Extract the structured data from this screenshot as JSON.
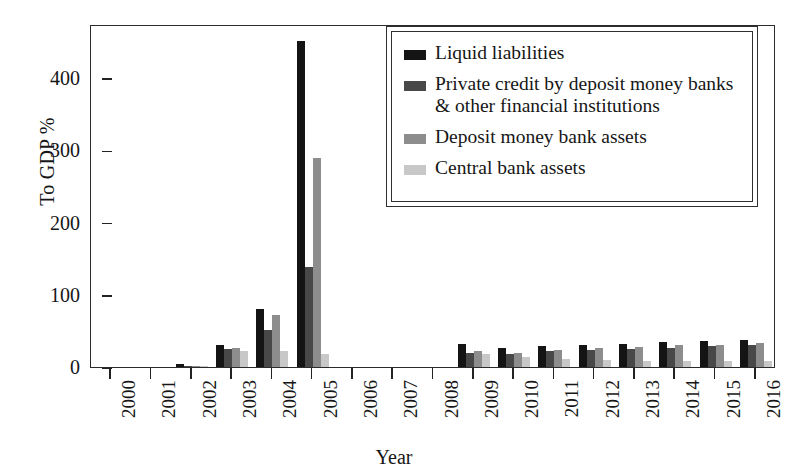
{
  "chart_data": {
    "type": "bar",
    "title": "",
    "xlabel": "Year",
    "ylabel": "To GDP %",
    "ylim": [
      0,
      475
    ],
    "yticks": [
      0,
      100,
      200,
      300,
      400
    ],
    "grid": false,
    "legend_position": "top-right",
    "categories": [
      "2000",
      "2001",
      "2002",
      "2003",
      "2004",
      "2005",
      "2006",
      "2007",
      "2008",
      "2009",
      "2010",
      "2011",
      "2012",
      "2013",
      "2014",
      "2015",
      "2016"
    ],
    "series": [
      {
        "name": "Liquid liabilities",
        "color": "#141414",
        "values": [
          0,
          0,
          4,
          30,
          81,
          452,
          0,
          0,
          0,
          32,
          26,
          29,
          30,
          32,
          34,
          36,
          38
        ]
      },
      {
        "name": "Private credit by deposit money banks & other financial institutions",
        "color": "#484848",
        "values": [
          0,
          0,
          2,
          25,
          51,
          138,
          0,
          0,
          0,
          20,
          18,
          22,
          24,
          25,
          27,
          29,
          30
        ]
      },
      {
        "name": "Deposit money bank assets",
        "color": "#8d8d8d",
        "values": [
          0,
          0,
          2,
          26,
          72,
          290,
          0,
          0,
          0,
          22,
          19,
          24,
          26,
          28,
          30,
          31,
          33
        ]
      },
      {
        "name": "Central bank assets",
        "color": "#c8c8c8",
        "values": [
          0,
          0,
          1,
          22,
          22,
          18,
          0,
          0,
          0,
          18,
          14,
          11,
          10,
          9,
          8,
          8,
          8
        ]
      }
    ]
  },
  "axis": {
    "y_title": "To GDP %",
    "x_title": "Year"
  }
}
